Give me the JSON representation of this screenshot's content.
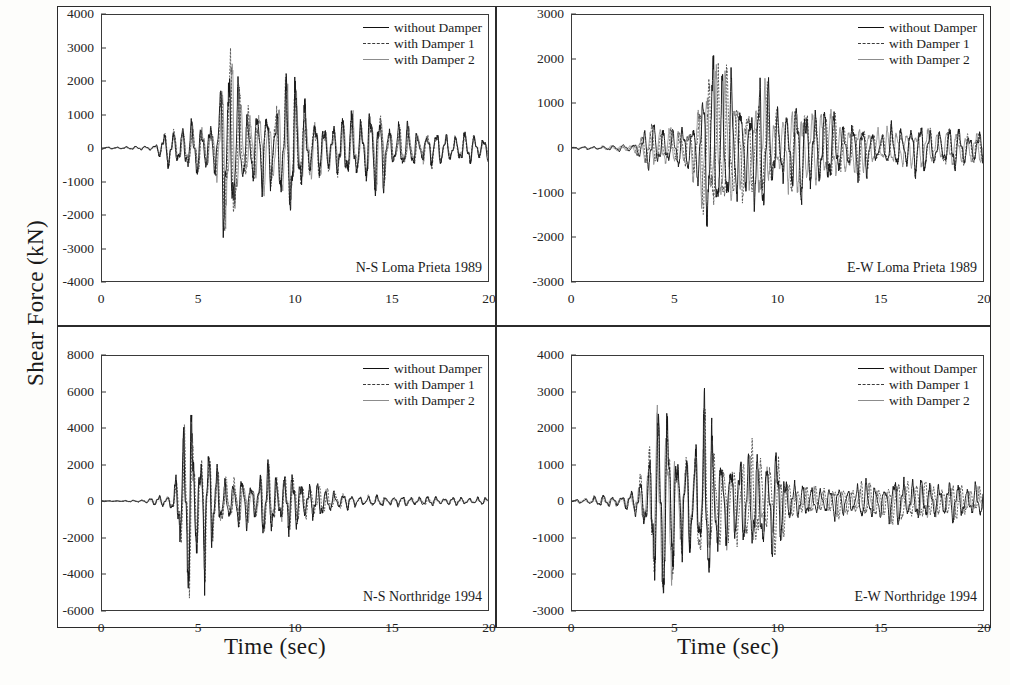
{
  "figure": {
    "ylabel": "Shear Force (kN)",
    "xlabel_left": "Time (sec)",
    "xlabel_right": "Time (sec)"
  },
  "legend": {
    "items": [
      {
        "label": "without Damper",
        "style": "solid",
        "color": "#111111"
      },
      {
        "label": "with Damper 1",
        "style": "dashed",
        "color": "#3b3b3b"
      },
      {
        "label": "with Damper 2",
        "style": "solid-grey",
        "color": "#8c8c8c"
      }
    ]
  },
  "chart_data": [
    {
      "type": "line",
      "panel": "top-left",
      "title": "N-S Loma Prieta 1989",
      "xlabel": "Time (sec)",
      "ylabel": "Shear Force (kN)",
      "xlim": [
        0,
        20
      ],
      "ylim": [
        -4000,
        4000
      ],
      "xticks": [
        0,
        5,
        10,
        15,
        20
      ],
      "yticks": [
        -4000,
        -3000,
        -2000,
        -1000,
        0,
        1000,
        2000,
        3000,
        4000
      ],
      "grid": false,
      "legend_position": "top-right",
      "peak_positive": 3050,
      "peak_negative": -3200,
      "peak_time": 6.8,
      "series": [
        {
          "name": "without Damper",
          "envelope_scale": 1.0
        },
        {
          "name": "with Damper 1",
          "envelope_scale": 0.93
        },
        {
          "name": "with Damper 2",
          "envelope_scale": 0.86
        }
      ],
      "envelope": [
        {
          "t": 0.0,
          "a": 30
        },
        {
          "t": 1.0,
          "a": 40
        },
        {
          "t": 2.0,
          "a": 60
        },
        {
          "t": 2.8,
          "a": 120
        },
        {
          "t": 3.4,
          "a": 600
        },
        {
          "t": 4.0,
          "a": 780
        },
        {
          "t": 4.6,
          "a": 820
        },
        {
          "t": 5.2,
          "a": 900
        },
        {
          "t": 5.8,
          "a": 1000
        },
        {
          "t": 6.2,
          "a": 2400
        },
        {
          "t": 6.6,
          "a": 3050
        },
        {
          "t": 7.0,
          "a": 3200
        },
        {
          "t": 7.4,
          "a": 1500
        },
        {
          "t": 7.9,
          "a": 900
        },
        {
          "t": 8.4,
          "a": 2100
        },
        {
          "t": 8.9,
          "a": 1500
        },
        {
          "t": 9.4,
          "a": 1900
        },
        {
          "t": 9.8,
          "a": 2400
        },
        {
          "t": 10.3,
          "a": 1950
        },
        {
          "t": 10.8,
          "a": 1100
        },
        {
          "t": 11.4,
          "a": 1000
        },
        {
          "t": 12.0,
          "a": 950
        },
        {
          "t": 12.6,
          "a": 900
        },
        {
          "t": 13.2,
          "a": 1300
        },
        {
          "t": 13.8,
          "a": 1250
        },
        {
          "t": 14.4,
          "a": 1300
        },
        {
          "t": 15.0,
          "a": 800
        },
        {
          "t": 15.8,
          "a": 650
        },
        {
          "t": 16.6,
          "a": 600
        },
        {
          "t": 17.4,
          "a": 520
        },
        {
          "t": 18.2,
          "a": 520
        },
        {
          "t": 19.0,
          "a": 480
        },
        {
          "t": 20.0,
          "a": 420
        }
      ]
    },
    {
      "type": "line",
      "panel": "top-right",
      "title": "E-W Loma Prieta 1989",
      "xlabel": "Time (sec)",
      "ylabel": "Shear Force (kN)",
      "xlim": [
        0,
        20
      ],
      "ylim": [
        -3000,
        3000
      ],
      "xticks": [
        0,
        5,
        10,
        15,
        20
      ],
      "yticks": [
        -3000,
        -2000,
        -1000,
        0,
        1000,
        2000,
        3000
      ],
      "grid": false,
      "legend_position": "top-right",
      "peak_positive": 2650,
      "peak_negative": -2300,
      "peak_time": 7.3,
      "series": [
        {
          "name": "without Damper",
          "envelope_scale": 1.0
        },
        {
          "name": "with Damper 1",
          "envelope_scale": 0.93
        },
        {
          "name": "with Damper 2",
          "envelope_scale": 0.86
        }
      ],
      "envelope": [
        {
          "t": 0.0,
          "a": 25
        },
        {
          "t": 1.2,
          "a": 45
        },
        {
          "t": 2.2,
          "a": 70
        },
        {
          "t": 3.0,
          "a": 110
        },
        {
          "t": 3.6,
          "a": 420
        },
        {
          "t": 4.0,
          "a": 620
        },
        {
          "t": 4.5,
          "a": 520
        },
        {
          "t": 5.0,
          "a": 380
        },
        {
          "t": 5.5,
          "a": 560
        },
        {
          "t": 6.0,
          "a": 900
        },
        {
          "t": 6.4,
          "a": 1700
        },
        {
          "t": 6.8,
          "a": 2100
        },
        {
          "t": 7.1,
          "a": 2300
        },
        {
          "t": 7.4,
          "a": 2650
        },
        {
          "t": 7.8,
          "a": 1400
        },
        {
          "t": 8.2,
          "a": 1100
        },
        {
          "t": 8.6,
          "a": 1300
        },
        {
          "t": 9.0,
          "a": 1500
        },
        {
          "t": 9.4,
          "a": 1600
        },
        {
          "t": 9.8,
          "a": 900
        },
        {
          "t": 10.3,
          "a": 1000
        },
        {
          "t": 10.8,
          "a": 1100
        },
        {
          "t": 11.3,
          "a": 1350
        },
        {
          "t": 11.8,
          "a": 1100
        },
        {
          "t": 12.3,
          "a": 850
        },
        {
          "t": 12.9,
          "a": 900
        },
        {
          "t": 13.5,
          "a": 600
        },
        {
          "t": 14.2,
          "a": 700
        },
        {
          "t": 15.0,
          "a": 420
        },
        {
          "t": 15.8,
          "a": 520
        },
        {
          "t": 16.6,
          "a": 600
        },
        {
          "t": 17.4,
          "a": 560
        },
        {
          "t": 18.2,
          "a": 540
        },
        {
          "t": 19.0,
          "a": 480
        },
        {
          "t": 20.0,
          "a": 380
        }
      ]
    },
    {
      "type": "line",
      "panel": "bottom-left",
      "title": "N-S Northridge 1994",
      "xlabel": "Time (sec)",
      "ylabel": "Shear Force (kN)",
      "xlim": [
        0,
        20
      ],
      "ylim": [
        -6000,
        8000
      ],
      "xticks": [
        0,
        5,
        10,
        15,
        20
      ],
      "yticks": [
        -6000,
        -4000,
        -2000,
        0,
        2000,
        4000,
        6000,
        8000
      ],
      "grid": false,
      "legend_position": "top-right",
      "peak_positive": 6350,
      "peak_negative": -5400,
      "peak_time": 4.5,
      "series": [
        {
          "name": "without Damper",
          "envelope_scale": 1.0
        },
        {
          "name": "with Damper 1",
          "envelope_scale": 0.92
        },
        {
          "name": "with Damper 2",
          "envelope_scale": 0.84
        }
      ],
      "envelope": [
        {
          "t": 0.0,
          "a": 20
        },
        {
          "t": 1.0,
          "a": 30
        },
        {
          "t": 2.0,
          "a": 60
        },
        {
          "t": 2.6,
          "a": 260
        },
        {
          "t": 3.0,
          "a": 320
        },
        {
          "t": 3.4,
          "a": 300
        },
        {
          "t": 3.8,
          "a": 1400
        },
        {
          "t": 4.1,
          "a": 3000
        },
        {
          "t": 4.35,
          "a": 4200
        },
        {
          "t": 4.55,
          "a": 6350
        },
        {
          "t": 4.8,
          "a": 5400
        },
        {
          "t": 5.0,
          "a": 3600
        },
        {
          "t": 5.3,
          "a": 4300
        },
        {
          "t": 5.6,
          "a": 2900
        },
        {
          "t": 5.9,
          "a": 2000
        },
        {
          "t": 6.3,
          "a": 1700
        },
        {
          "t": 6.7,
          "a": 1500
        },
        {
          "t": 7.1,
          "a": 1400
        },
        {
          "t": 7.5,
          "a": 1300
        },
        {
          "t": 8.0,
          "a": 1400
        },
        {
          "t": 8.4,
          "a": 2300
        },
        {
          "t": 8.8,
          "a": 1900
        },
        {
          "t": 9.2,
          "a": 1700
        },
        {
          "t": 9.6,
          "a": 1800
        },
        {
          "t": 10.0,
          "a": 1500
        },
        {
          "t": 10.5,
          "a": 1300
        },
        {
          "t": 11.0,
          "a": 1100
        },
        {
          "t": 11.6,
          "a": 800
        },
        {
          "t": 12.2,
          "a": 600
        },
        {
          "t": 13.0,
          "a": 420
        },
        {
          "t": 14.0,
          "a": 340
        },
        {
          "t": 15.0,
          "a": 300
        },
        {
          "t": 16.0,
          "a": 280
        },
        {
          "t": 17.0,
          "a": 260
        },
        {
          "t": 18.0,
          "a": 240
        },
        {
          "t": 19.0,
          "a": 220
        },
        {
          "t": 20.0,
          "a": 200
        }
      ]
    },
    {
      "type": "line",
      "panel": "bottom-right",
      "title": "E-W Northridge 1994",
      "xlabel": "Time (sec)",
      "ylabel": "Shear Force (kN)",
      "xlim": [
        0,
        20
      ],
      "ylim": [
        -3000,
        4000
      ],
      "xticks": [
        0,
        5,
        10,
        15,
        20
      ],
      "yticks": [
        -3000,
        -2000,
        -1000,
        0,
        1000,
        2000,
        3000,
        4000
      ],
      "grid": false,
      "legend_position": "top-right",
      "peak_positive": 2900,
      "peak_negative": -2750,
      "peak_time": 4.3,
      "series": [
        {
          "name": "without Damper",
          "envelope_scale": 1.0
        },
        {
          "name": "with Damper 1",
          "envelope_scale": 0.93
        },
        {
          "name": "with Damper 2",
          "envelope_scale": 0.85
        }
      ],
      "envelope": [
        {
          "t": 0.0,
          "a": 25
        },
        {
          "t": 1.0,
          "a": 130
        },
        {
          "t": 1.8,
          "a": 180
        },
        {
          "t": 2.4,
          "a": 200
        },
        {
          "t": 3.0,
          "a": 300
        },
        {
          "t": 3.4,
          "a": 900
        },
        {
          "t": 3.7,
          "a": 1500
        },
        {
          "t": 4.0,
          "a": 2700
        },
        {
          "t": 4.3,
          "a": 2900
        },
        {
          "t": 4.6,
          "a": 2750
        },
        {
          "t": 4.9,
          "a": 2800
        },
        {
          "t": 5.2,
          "a": 1700
        },
        {
          "t": 5.6,
          "a": 1500
        },
        {
          "t": 6.0,
          "a": 1400
        },
        {
          "t": 6.4,
          "a": 2800
        },
        {
          "t": 6.7,
          "a": 2750
        },
        {
          "t": 7.0,
          "a": 1400
        },
        {
          "t": 7.4,
          "a": 1200
        },
        {
          "t": 7.8,
          "a": 1500
        },
        {
          "t": 8.2,
          "a": 1400
        },
        {
          "t": 8.6,
          "a": 1300
        },
        {
          "t": 9.0,
          "a": 1800
        },
        {
          "t": 9.4,
          "a": 1500
        },
        {
          "t": 9.8,
          "a": 1600
        },
        {
          "t": 10.2,
          "a": 1200
        },
        {
          "t": 10.6,
          "a": 700
        },
        {
          "t": 11.0,
          "a": 450
        },
        {
          "t": 11.6,
          "a": 420
        },
        {
          "t": 12.2,
          "a": 500
        },
        {
          "t": 12.8,
          "a": 450
        },
        {
          "t": 13.6,
          "a": 520
        },
        {
          "t": 14.4,
          "a": 560
        },
        {
          "t": 15.2,
          "a": 620
        },
        {
          "t": 16.0,
          "a": 650
        },
        {
          "t": 16.8,
          "a": 640
        },
        {
          "t": 17.6,
          "a": 600
        },
        {
          "t": 18.4,
          "a": 560
        },
        {
          "t": 19.2,
          "a": 500
        },
        {
          "t": 20.0,
          "a": 420
        }
      ]
    }
  ]
}
